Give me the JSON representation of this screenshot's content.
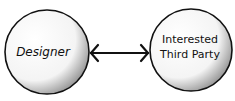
{
  "diagram": {
    "type": "relationship",
    "nodes": [
      {
        "id": "designer",
        "label_lines": [
          "Designer"
        ]
      },
      {
        "id": "third_party",
        "label_lines": [
          "Interested",
          "Third Party"
        ]
      }
    ],
    "edges": [
      {
        "from": "designer",
        "to": "third_party",
        "style": "double-headed-arrow"
      }
    ]
  },
  "colors": {
    "ink": "#111111",
    "background": "#ffffff",
    "stipple": "#333333"
  }
}
